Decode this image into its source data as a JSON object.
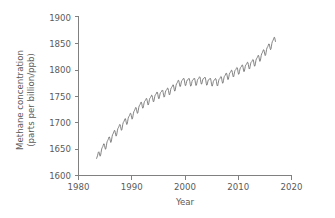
{
  "chart_data": {
    "type": "line",
    "title": "",
    "xlabel": "Year",
    "ylabel": "Methane concentration (parts per billion/ppb)",
    "ylabel_line1": "Methane concentration",
    "ylabel_line2": "(parts per billion/ppb)",
    "xlim": [
      1980,
      2020
    ],
    "ylim": [
      1600,
      1900
    ],
    "xticks": [
      1980,
      1990,
      2000,
      2010,
      2020
    ],
    "xtick_labels": [
      "1980",
      "1990",
      "2000",
      "2010",
      "2020"
    ],
    "yticks": [
      1600,
      1650,
      1700,
      1750,
      1800,
      1850,
      1900
    ],
    "ytick_labels": [
      "1600",
      "1650",
      "1700",
      "1750",
      "1800",
      "1850",
      "1900"
    ],
    "grid": false,
    "legend": "none",
    "line_color": "#6e6e6e",
    "axis_color": "#808080",
    "text_color": "#5a5a5a",
    "background_color": "#ffffff",
    "series": [
      {
        "name": "Global mean atmospheric methane",
        "x_start": 1983.4,
        "x_end": 2017.0,
        "sampling": "monthly",
        "seasonal_amplitude_ppb": 8,
        "x": [
          1983.4,
          1983.5,
          1983.6,
          1983.7,
          1983.8,
          1983.9,
          1984.0,
          1984.1,
          1984.2,
          1984.3,
          1984.4,
          1984.5,
          1984.6,
          1984.7,
          1984.8,
          1984.9,
          1985.0,
          1985.1,
          1985.2,
          1985.3,
          1985.4,
          1985.5,
          1985.6,
          1985.7,
          1985.8,
          1985.9,
          1986.0,
          1986.2,
          1986.4,
          1986.6,
          1986.8,
          1987.0,
          1987.2,
          1987.4,
          1987.6,
          1987.8,
          1988.0,
          1988.2,
          1988.4,
          1988.6,
          1988.8,
          1989.0,
          1989.2,
          1989.4,
          1989.6,
          1989.8,
          1990.0,
          1990.2,
          1990.4,
          1990.6,
          1990.8,
          1991.0,
          1991.2,
          1991.4,
          1991.6,
          1991.8,
          1992.0,
          1992.2,
          1992.4,
          1992.6,
          1992.8,
          1993.0,
          1993.2,
          1993.4,
          1993.6,
          1993.8,
          1994.0,
          1994.2,
          1994.4,
          1994.6,
          1994.8,
          1995.0,
          1995.2,
          1995.4,
          1995.6,
          1995.8,
          1996.0,
          1996.2,
          1996.4,
          1996.6,
          1996.8,
          1997.0,
          1997.2,
          1997.4,
          1997.6,
          1997.8,
          1998.0,
          1998.2,
          1998.4,
          1998.6,
          1998.8,
          1999.0,
          1999.2,
          1999.4,
          1999.6,
          1999.8,
          2000.0,
          2000.2,
          2000.4,
          2000.6,
          2000.8,
          2001.0,
          2001.2,
          2001.4,
          2001.6,
          2001.8,
          2002.0,
          2002.2,
          2002.4,
          2002.6,
          2002.8,
          2003.0,
          2003.2,
          2003.4,
          2003.6,
          2003.8,
          2004.0,
          2004.2,
          2004.4,
          2004.6,
          2004.8,
          2005.0,
          2005.2,
          2005.4,
          2005.6,
          2005.8,
          2006.0,
          2006.2,
          2006.4,
          2006.6,
          2006.8,
          2007.0,
          2007.2,
          2007.4,
          2007.6,
          2007.8,
          2008.0,
          2008.2,
          2008.4,
          2008.6,
          2008.8,
          2009.0,
          2009.2,
          2009.4,
          2009.6,
          2009.8,
          2010.0,
          2010.2,
          2010.4,
          2010.6,
          2010.8,
          2011.0,
          2011.2,
          2011.4,
          2011.6,
          2011.8,
          2012.0,
          2012.2,
          2012.4,
          2012.6,
          2012.8,
          2013.0,
          2013.2,
          2013.4,
          2013.6,
          2013.8,
          2014.0,
          2014.2,
          2014.4,
          2014.6,
          2014.8,
          2015.0,
          2015.2,
          2015.4,
          2015.6,
          2015.8,
          2016.0,
          2016.2,
          2016.4,
          2016.6,
          2016.8,
          2017.0
        ],
        "annual_mean_points": [
          {
            "year": 1983.4,
            "value": 1630
          },
          {
            "year": 1984,
            "value": 1644
          },
          {
            "year": 1985,
            "value": 1657
          },
          {
            "year": 1986,
            "value": 1670
          },
          {
            "year": 1987,
            "value": 1682
          },
          {
            "year": 1988,
            "value": 1693
          },
          {
            "year": 1989,
            "value": 1704
          },
          {
            "year": 1990,
            "value": 1714
          },
          {
            "year": 1991,
            "value": 1725
          },
          {
            "year": 1992,
            "value": 1735
          },
          {
            "year": 1993,
            "value": 1741
          },
          {
            "year": 1994,
            "value": 1747
          },
          {
            "year": 1995,
            "value": 1753
          },
          {
            "year": 1996,
            "value": 1756
          },
          {
            "year": 1997,
            "value": 1760
          },
          {
            "year": 1998,
            "value": 1767
          },
          {
            "year": 1999,
            "value": 1776
          },
          {
            "year": 2000,
            "value": 1778
          },
          {
            "year": 2001,
            "value": 1777
          },
          {
            "year": 2002,
            "value": 1778
          },
          {
            "year": 2003,
            "value": 1781
          },
          {
            "year": 2004,
            "value": 1779
          },
          {
            "year": 2005,
            "value": 1777
          },
          {
            "year": 2006,
            "value": 1777
          },
          {
            "year": 2007,
            "value": 1782
          },
          {
            "year": 2008,
            "value": 1789
          },
          {
            "year": 2009,
            "value": 1794
          },
          {
            "year": 2010,
            "value": 1799
          },
          {
            "year": 2011,
            "value": 1804
          },
          {
            "year": 2012,
            "value": 1809
          },
          {
            "year": 2013,
            "value": 1814
          },
          {
            "year": 2014,
            "value": 1823
          },
          {
            "year": 2015,
            "value": 1834
          },
          {
            "year": 2016,
            "value": 1845
          },
          {
            "year": 2017,
            "value": 1858
          }
        ]
      }
    ]
  }
}
